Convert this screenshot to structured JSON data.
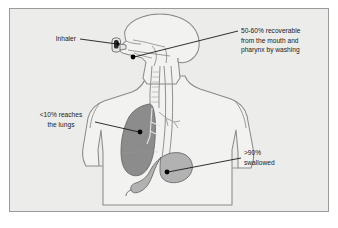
{
  "figure": {
    "page_background": "#ffffff",
    "panel_background": "#ececeb",
    "frame_border_color": "#9a9a9a",
    "line_color": "#6f6f6f",
    "leader_color": "#1a1a1a",
    "text_color": "#1a1a1a"
  },
  "colors": {
    "lung_fill": "#8c8c8c",
    "lung_stroke": "#6a6a6a",
    "stomach_fill": "#b2b2b2",
    "stomach_stroke": "#6a6a6a",
    "body_fill": "#f2f2f1",
    "body_stroke": "#8a8a8a",
    "inhaler_body": "#e8e8e8",
    "inhaler_canister": "#2b2b2b",
    "marker_dot": "#000000"
  },
  "annotations": [
    {
      "id": "inhaler",
      "name": "inhaler-label",
      "lines": [
        "Inhaler"
      ],
      "align": "end",
      "x": 76,
      "y": 41,
      "line_height": 9.2
    },
    {
      "id": "mouth-pharynx",
      "name": "mouth-pharynx-label",
      "lines": [
        "50-60% recoverable",
        "from the mouth and",
        "pharynx by washing"
      ],
      "align": "start",
      "x": 241,
      "y": 33,
      "line_height": 9.6
    },
    {
      "id": "lungs",
      "name": "lungs-label",
      "lines": [
        "<10% reaches",
        "the lungs"
      ],
      "align": "middle",
      "x": 61,
      "y": 117,
      "line_height": 9.6
    },
    {
      "id": "swallowed",
      "name": "swallowed-label",
      "lines": [
        ">90%",
        "swallowed"
      ],
      "align": "start",
      "x": 244,
      "y": 155,
      "line_height": 9.6
    }
  ],
  "markers": [
    {
      "id": "inhaler-point",
      "name": "inhaler-marker",
      "cx": 118,
      "cy": 44,
      "r": 1.7
    },
    {
      "id": "pharynx-point",
      "name": "pharynx-marker",
      "cx": 133,
      "cy": 57,
      "r": 2.4
    },
    {
      "id": "lung-point",
      "name": "lung-marker",
      "cx": 140,
      "cy": 132,
      "r": 2.4
    },
    {
      "id": "stomach-point",
      "name": "stomach-marker",
      "cx": 167,
      "cy": 172,
      "r": 2.4
    }
  ],
  "leader_lines": [
    {
      "id": "inhaler-leader",
      "name": "inhaler-leader-line",
      "x1": 80,
      "y1": 39,
      "x2": 117,
      "y2": 44
    },
    {
      "id": "pharynx-leader",
      "name": "pharynx-leader-line",
      "x1": 238,
      "y1": 31,
      "x2": 134,
      "y2": 57
    },
    {
      "id": "lung-leader",
      "name": "lung-leader-line",
      "x1": 95,
      "y1": 122,
      "x2": 139,
      "y2": 132
    },
    {
      "id": "stomach-leader",
      "name": "stomach-leader-line",
      "x1": 241,
      "y1": 158,
      "x2": 168,
      "y2": 172
    }
  ]
}
